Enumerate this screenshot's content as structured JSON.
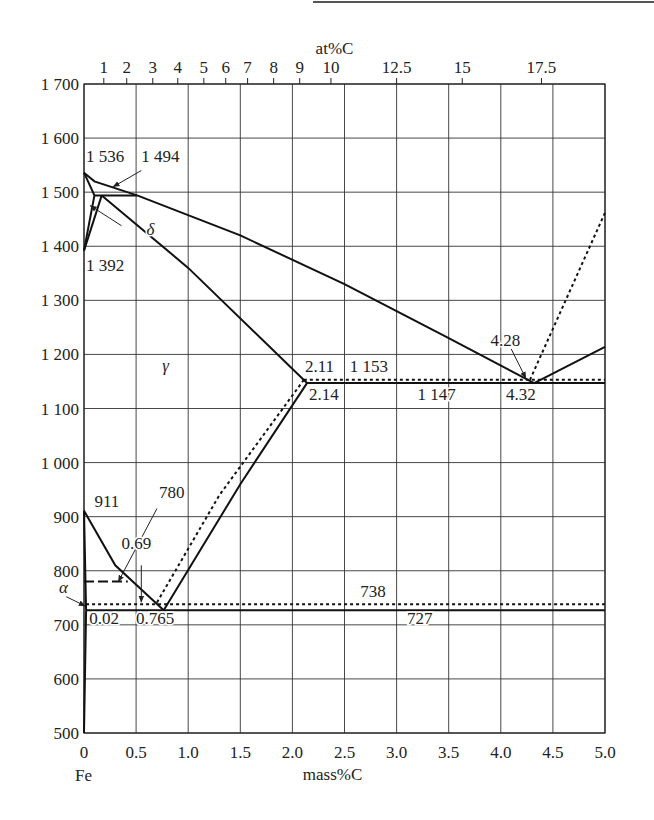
{
  "chart_data": {
    "type": "line",
    "xlabel": "mass%C",
    "xlabel_top": "at%C",
    "ylabel": "",
    "xlim": [
      0,
      5.0
    ],
    "ylim": [
      500,
      1700
    ],
    "grid": true,
    "x_ticks": [
      "0",
      "0.5",
      "1.0",
      "1.5",
      "2.0",
      "2.5",
      "3.0",
      "3.5",
      "4.0",
      "4.5",
      "5.0"
    ],
    "x_ticks_values": [
      0,
      0.5,
      1.0,
      1.5,
      2.0,
      2.5,
      3.0,
      3.5,
      4.0,
      4.5,
      5.0
    ],
    "y_ticks": [
      "500",
      "600",
      "700",
      "800",
      "900",
      "1 000",
      "1 100",
      "1 200",
      "1 300",
      "1 400",
      "1 500",
      "1 600",
      "1 700"
    ],
    "y_ticks_values": [
      500,
      600,
      700,
      800,
      900,
      1000,
      1100,
      1200,
      1300,
      1400,
      1500,
      1600,
      1700
    ],
    "top_ticks": [
      {
        "label": "1",
        "mass": 0.19
      },
      {
        "label": "2",
        "mass": 0.41
      },
      {
        "label": "3",
        "mass": 0.66
      },
      {
        "label": "4",
        "mass": 0.9
      },
      {
        "label": "5",
        "mass": 1.15
      },
      {
        "label": "6",
        "mass": 1.36
      },
      {
        "label": "7",
        "mass": 1.57
      },
      {
        "label": "8",
        "mass": 1.82
      },
      {
        "label": "9",
        "mass": 2.07
      },
      {
        "label": "10",
        "mass": 2.37
      },
      {
        "label": "12.5",
        "mass": 3.0
      },
      {
        "label": "15",
        "mass": 3.63
      },
      {
        "label": "17.5",
        "mass": 4.39
      }
    ],
    "origin_label": "Fe",
    "series": [
      {
        "name": "liquidus-left",
        "style": "solid",
        "points": [
          [
            0,
            1536
          ],
          [
            0.1,
            1520
          ],
          [
            0.51,
            1494
          ]
        ]
      },
      {
        "name": "liquidus-main",
        "style": "solid",
        "points": [
          [
            0.51,
            1494
          ],
          [
            1.5,
            1420
          ],
          [
            2.5,
            1330
          ],
          [
            3.5,
            1230
          ],
          [
            4.32,
            1147
          ]
        ]
      },
      {
        "name": "liquidus-right",
        "style": "solid",
        "points": [
          [
            4.32,
            1147
          ],
          [
            5.0,
            1214
          ]
        ]
      },
      {
        "name": "delta-solidus",
        "style": "solid",
        "points": [
          [
            0,
            1536
          ],
          [
            0.1,
            1494
          ]
        ]
      },
      {
        "name": "peritectic",
        "style": "solid",
        "points": [
          [
            0.1,
            1494
          ],
          [
            0.51,
            1494
          ]
        ]
      },
      {
        "name": "delta-gamma-upper",
        "style": "solid",
        "points": [
          [
            0.1,
            1494
          ],
          [
            0,
            1392
          ]
        ]
      },
      {
        "name": "delta-gamma-lower",
        "style": "solid",
        "points": [
          [
            0.17,
            1494
          ],
          [
            0,
            1392
          ]
        ]
      },
      {
        "name": "solidus-gamma",
        "style": "solid",
        "points": [
          [
            0.17,
            1494
          ],
          [
            1.0,
            1360
          ],
          [
            2.14,
            1147
          ]
        ]
      },
      {
        "name": "eutectic-stable",
        "style": "solid",
        "points": [
          [
            2.14,
            1147
          ],
          [
            5.0,
            1147
          ]
        ]
      },
      {
        "name": "eutectic-graphite",
        "style": "dotted",
        "points": [
          [
            2.11,
            1153
          ],
          [
            5.0,
            1153
          ]
        ]
      },
      {
        "name": "acm-stable",
        "style": "solid",
        "points": [
          [
            2.14,
            1147
          ],
          [
            1.5,
            960
          ],
          [
            0.765,
            727
          ]
        ]
      },
      {
        "name": "acm-graphite",
        "style": "dotted",
        "points": [
          [
            2.11,
            1153
          ],
          [
            1.3,
            940
          ],
          [
            0.69,
            738
          ]
        ]
      },
      {
        "name": "a3",
        "style": "solid",
        "points": [
          [
            0,
            911
          ],
          [
            0.3,
            810
          ],
          [
            0.765,
            727
          ]
        ]
      },
      {
        "name": "eutectoid-stable",
        "style": "solid",
        "points": [
          [
            0.02,
            727
          ],
          [
            5.0,
            727
          ]
        ]
      },
      {
        "name": "eutectoid-graphite",
        "style": "dotted",
        "points": [
          [
            0.02,
            738
          ],
          [
            5.0,
            738
          ]
        ]
      },
      {
        "name": "curie",
        "style": "dashed",
        "points": [
          [
            0,
            780
          ],
          [
            0.42,
            780
          ]
        ]
      },
      {
        "name": "alpha-solvus",
        "style": "solid",
        "points": [
          [
            0,
            911
          ],
          [
            0.02,
            727
          ]
        ]
      },
      {
        "name": "alpha-solvus-low",
        "style": "solid",
        "points": [
          [
            0.02,
            727
          ],
          [
            0,
            500
          ]
        ]
      },
      {
        "name": "graphite-liquidus",
        "style": "dotted",
        "points": [
          [
            4.28,
            1153
          ],
          [
            5.0,
            1462
          ]
        ]
      }
    ],
    "annotations": [
      {
        "text": "1 536",
        "x": 0.02,
        "y": 1556
      },
      {
        "text": "1 494",
        "x": 0.55,
        "y": 1556
      },
      {
        "text": "δ",
        "x": 0.6,
        "y": 1420,
        "italic": true
      },
      {
        "text": "1 392",
        "x": 0.02,
        "y": 1355
      },
      {
        "text": "γ",
        "x": 0.75,
        "y": 1170,
        "italic": true
      },
      {
        "text": "2.11",
        "x": 2.12,
        "y": 1168
      },
      {
        "text": "1 153",
        "x": 2.55,
        "y": 1168
      },
      {
        "text": "2.14",
        "x": 2.16,
        "y": 1115
      },
      {
        "text": "1 147",
        "x": 3.2,
        "y": 1115
      },
      {
        "text": "4.28",
        "x": 3.9,
        "y": 1215
      },
      {
        "text": "4.32",
        "x": 4.05,
        "y": 1115
      },
      {
        "text": "911",
        "x": 0.1,
        "y": 918
      },
      {
        "text": "780",
        "x": 0.72,
        "y": 935
      },
      {
        "text": "0.69",
        "x": 0.36,
        "y": 840
      },
      {
        "text": "α",
        "x": -0.24,
        "y": 758,
        "italic": true
      },
      {
        "text": "738",
        "x": 2.65,
        "y": 751
      },
      {
        "text": "0.02",
        "x": 0.05,
        "y": 702
      },
      {
        "text": "0.765",
        "x": 0.5,
        "y": 702
      },
      {
        "text": "727",
        "x": 3.1,
        "y": 702
      }
    ],
    "arrows": [
      {
        "from": [
          0.55,
          1540
        ],
        "to": [
          0.28,
          1510
        ]
      },
      {
        "from": [
          0.36,
          1438
        ],
        "to": [
          0.06,
          1475
        ]
      },
      {
        "from": [
          0.7,
          915
        ],
        "to": [
          0.33,
          780
        ]
      },
      {
        "from": [
          0.55,
          810
        ],
        "to": [
          0.55,
          742
        ]
      },
      {
        "from": [
          -0.17,
          752
        ],
        "to": [
          0.01,
          735
        ]
      },
      {
        "from": [
          4.1,
          1210
        ],
        "to": [
          4.24,
          1156
        ]
      }
    ]
  }
}
